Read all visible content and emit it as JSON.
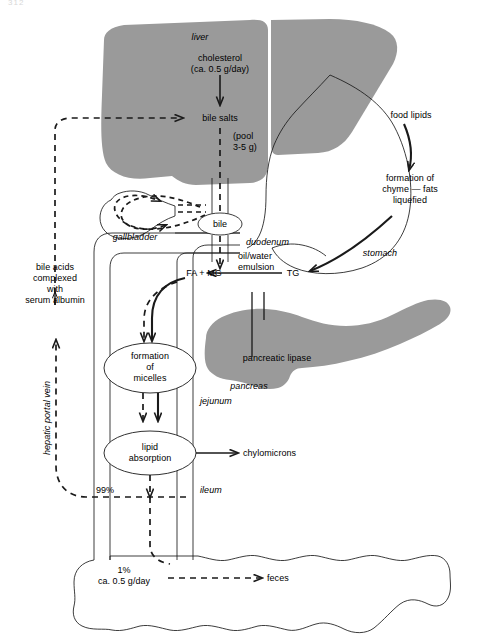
{
  "page": {
    "page_number": "312",
    "bg_color": "#ffffff",
    "organ_fill": "#9a9a9a",
    "line_color": "#1a1a1a"
  },
  "organs": {
    "liver": "liver",
    "gallbladder": "gallbladder",
    "stomach": "stomach",
    "pancreas": "pancreas",
    "duodenum": "duodenum",
    "jejunum": "jejunum",
    "ileum": "ileum"
  },
  "nodes": {
    "bile": "bile",
    "micelles": "formation\nof\nmicelles",
    "micelles_line1": "formation",
    "micelles_line2": "of",
    "micelles_line3": "micelles",
    "absorption_line1": "lipid",
    "absorption_line2": "absorption"
  },
  "labels": {
    "cholesterol": "cholesterol",
    "cholesterol_amount": "(ca. 0.5 g/day)",
    "bile_salts": "bile salts",
    "bile_pool_line1": "(pool",
    "bile_pool_line2": "3-5 g)",
    "food_lipids": "food lipids",
    "chyme_line1": "formation of",
    "chyme_line2": "chyme — fats",
    "chyme_line3": "liquefied",
    "oil_water_line1": "oil/water",
    "oil_water_line2": "emulsion",
    "tg": "TG",
    "fa_mg": "FA + MG",
    "pancreatic_lipase": "pancreatic lipase",
    "chylomicrons": "chylomicrons",
    "serum_albumin_line1": "bile acids",
    "serum_albumin_line2": "complexed",
    "serum_albumin_line3": "with",
    "serum_albumin_line4": "serum albumin",
    "hepatic_portal_vein": "hepatic portal vein",
    "pct_99": "99%",
    "pct_1": "1%",
    "pct_1_amount": "ca. 0.5 g/day",
    "feces": "feces"
  }
}
